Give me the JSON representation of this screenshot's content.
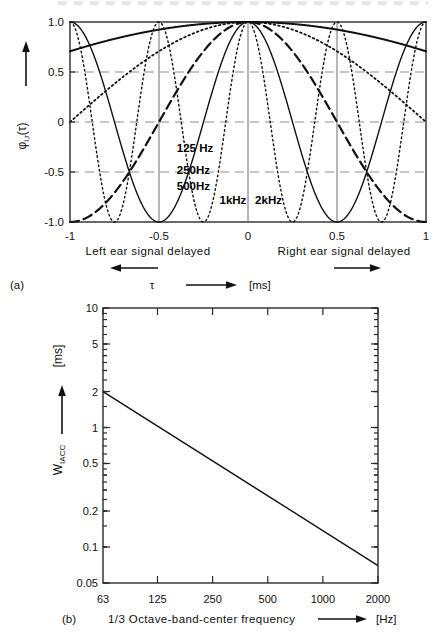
{
  "figure": {
    "panel_a_tag": "(a)",
    "panel_b_tag": "(b)"
  },
  "panel_a": {
    "ylabel": "φ",
    "ylabel_sub": "l,r",
    "ylabel_arg": "(τ)",
    "xlabel_symbol": "τ",
    "xlabel_unit": "[ms]",
    "left_caption": "Left ear signal delayed",
    "right_caption": "Right ear signal delayed",
    "ytick_labels": [
      "1.0",
      "0.5",
      "0",
      "-0.5",
      "-1.0"
    ],
    "xtick_labels": [
      "-1",
      "-0.5",
      "0",
      "0.5",
      "1"
    ],
    "curve_labels": [
      {
        "text": "125 Hz",
        "x": 0.3,
        "y": 0.35
      },
      {
        "text": "250Hz",
        "x": 0.3,
        "y": 0.24
      },
      {
        "text": "500Hz",
        "x": 0.3,
        "y": 0.16
      },
      {
        "text": "1kHz",
        "x": 0.42,
        "y": 0.09
      },
      {
        "text": "2kHz",
        "x": 0.52,
        "y": 0.09
      }
    ]
  },
  "panel_b": {
    "ylabel": "W",
    "ylabel_sub": "IACC",
    "ylabel_unit": "[ms]",
    "xlabel": "1/3 Octave-band-center frequency",
    "xlabel_unit": "[Hz]",
    "ytick_labels": [
      "10",
      "5",
      "2",
      "1",
      "0.5",
      "0.2",
      "0.1",
      "0.05"
    ],
    "xtick_labels": [
      "63",
      "125",
      "250",
      "500",
      "1000",
      "2000"
    ]
  },
  "chart_data": [
    {
      "type": "line",
      "id": "panel-a-iacc-functions",
      "title": "Interaural cross-correlation functions",
      "xlabel": "τ [ms]",
      "ylabel": "φ l,r (τ)",
      "xlim": [
        -1,
        1
      ],
      "ylim": [
        -1.0,
        1.0
      ],
      "xticks": [
        -1,
        -0.5,
        0,
        0.5,
        1
      ],
      "yticks": [
        1.0,
        0.5,
        0,
        -0.5,
        -1.0
      ],
      "grid": "horizontal dashed at 0.5, 0, -0.5; vertical at -0.5, 0, 0.5",
      "legend": "inline curve labels",
      "annotations": [
        "Left ear signal delayed",
        "Right ear signal delayed"
      ],
      "series": [
        {
          "name": "125 Hz",
          "frequency_hz": 125,
          "style": "solid",
          "width": 2.0,
          "model": "cos(2*pi*f*tau/1000)",
          "period_ms": 8.0
        },
        {
          "name": "250Hz",
          "frequency_hz": 250,
          "style": "dotted",
          "width": 1.8,
          "model": "cos(2*pi*f*tau/1000)",
          "period_ms": 4.0
        },
        {
          "name": "500Hz",
          "frequency_hz": 500,
          "style": "dashed",
          "width": 2.2,
          "model": "cos(2*pi*f*tau/1000)",
          "period_ms": 2.0
        },
        {
          "name": "1kHz",
          "frequency_hz": 1000,
          "style": "solid",
          "width": 1.4,
          "model": "cos(2*pi*f*tau/1000)",
          "period_ms": 1.0
        },
        {
          "name": "2kHz",
          "frequency_hz": 2000,
          "style": "dotted",
          "width": 1.4,
          "model": "cos(2*pi*f*tau/1000)",
          "period_ms": 0.5
        }
      ]
    },
    {
      "type": "line",
      "id": "panel-b-wiacc",
      "title": "W_IACC versus 1/3 octave-band-center frequency",
      "xlabel": "1/3 Octave-band-center frequency [Hz]",
      "ylabel": "W IACC [ms]",
      "xscale": "log",
      "yscale": "log",
      "xlim": [
        63,
        2000
      ],
      "ylim": [
        0.05,
        10
      ],
      "xticks": [
        63,
        125,
        250,
        500,
        1000,
        2000
      ],
      "yticks": [
        10,
        5,
        2,
        1,
        0.5,
        0.2,
        0.1,
        0.05
      ],
      "grid": "none",
      "series": [
        {
          "name": "W_IACC",
          "style": "solid",
          "x": [
            63,
            2000
          ],
          "y": [
            2.0,
            0.07
          ]
        }
      ]
    }
  ]
}
